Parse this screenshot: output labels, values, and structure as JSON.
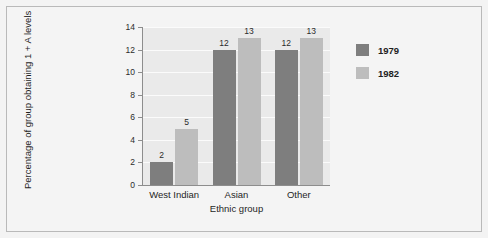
{
  "chart_data": {
    "type": "bar",
    "title": "",
    "subtitle": "",
    "categories": [
      "West Indian",
      "Asian",
      "Other"
    ],
    "series": [
      {
        "name": "1979",
        "values": [
          2,
          12,
          12
        ],
        "color": "#7e7e7e"
      },
      {
        "name": "1982",
        "values": [
          5,
          13,
          13
        ],
        "color": "#bdbdbd"
      }
    ],
    "xlabel": "Ethnic group",
    "ylabel": "Percentage of group obtaining 1 + A levels",
    "ylim": [
      0,
      14
    ],
    "yticks": [
      0,
      2,
      4,
      6,
      8,
      10,
      12,
      14
    ],
    "ytick_labels": [
      "0",
      "2",
      "4",
      "6",
      "8",
      "10",
      "12",
      "14"
    ],
    "data_labels": [
      [
        "2",
        "12",
        "12"
      ],
      [
        "5",
        "13",
        "13"
      ]
    ],
    "grid": "horizontal",
    "legend_position": "right",
    "plot_background": "#eaeaea",
    "gridline_color": "#fbfbfb",
    "figure_background": "#f4f4f4"
  }
}
